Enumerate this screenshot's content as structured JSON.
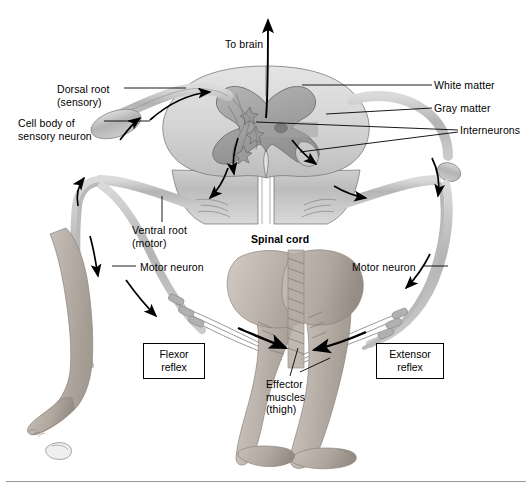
{
  "figure": {
    "title_visible": false,
    "background_color": "#ffffff",
    "width": 532,
    "height": 498
  },
  "palette": {
    "white_matter": "#d6d6d6",
    "gray_matter": "#a9a9a9",
    "gray_matter_dark": "#8f8f8f",
    "nerve": "#c2c2c2",
    "nerve_dark": "#9d9d9d",
    "skin": "#bdb5ae",
    "skin_shadow": "#9e968f",
    "outline": "#000000",
    "rule": "#9a9a9a"
  },
  "labels": {
    "to_brain": "To brain",
    "dorsal_root": "Dorsal root\n(sensory)",
    "cell_body": "Cell body of\nsensory neuron",
    "white_matter": "White matter",
    "gray_matter": "Gray matter",
    "interneurons": "Interneurons",
    "ventral_root": "Ventral root\n(motor)",
    "spinal_cord": "Spinal cord",
    "motor_neuron_left": "Motor neuron",
    "motor_neuron_right": "Motor neuron",
    "effector_muscles": "Effector\nmuscles\n(thigh)"
  },
  "boxed_labels": {
    "flexor_reflex": "Flexor\nreflex",
    "extensor_reflex": "Extensor\nreflex"
  },
  "label_positions": {
    "to_brain": {
      "x": 225,
      "y": 38
    },
    "dorsal_root": {
      "x": 57,
      "y": 83
    },
    "cell_body": {
      "x": 18,
      "y": 117
    },
    "white_matter": {
      "x": 434,
      "y": 81
    },
    "gray_matter": {
      "x": 434,
      "y": 104
    },
    "interneurons": {
      "x": 460,
      "y": 126
    },
    "ventral_root": {
      "x": 132,
      "y": 224
    },
    "spinal_cord": {
      "x": 251,
      "y": 233
    },
    "motor_neuron_left": {
      "x": 140,
      "y": 262
    },
    "motor_neuron_right": {
      "x": 352,
      "y": 262
    },
    "effector_muscles": {
      "x": 266,
      "y": 380
    },
    "flexor_reflex": {
      "x": 143,
      "y": 343,
      "w": 62,
      "h": 36
    },
    "extensor_reflex": {
      "x": 376,
      "y": 343,
      "w": 68,
      "h": 36
    }
  },
  "arrows": {
    "to_brain_direction": "up",
    "sensory_pathway_direction": "toward-cord",
    "motor_pathway_direction": "away-from-cord",
    "count_flow_arrows": 10
  },
  "anatomy_parts": [
    "spinal cord cross-section",
    "white matter",
    "gray matter (butterfly)",
    "central canal",
    "dorsal root",
    "dorsal root ganglion (cell body of sensory neuron)",
    "ventral root",
    "interneurons",
    "motor neurons",
    "flexed left leg with foot",
    "extended right leg with foot",
    "thigh effector muscles",
    "tack on floor"
  ]
}
